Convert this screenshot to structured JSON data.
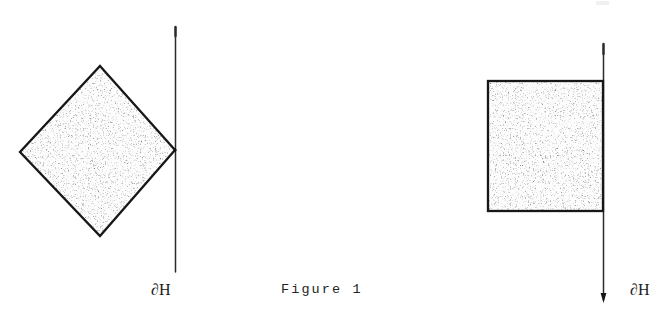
{
  "figure": {
    "caption": "Figure 1",
    "caption_font": "typewriter",
    "background_color": "#ffffff",
    "ink_color": "#1a1a1a",
    "fill_color": "#fefefe",
    "panels": [
      {
        "id": "left-panel",
        "shape": {
          "name": "rotated-square-diamond",
          "type": "polygon",
          "description": "stippled square rotated 45 degrees, right vertex touching the vertical boundary line",
          "vertices": [
            {
              "x": 100,
              "y": 66
            },
            {
              "x": 175,
              "y": 150
            },
            {
              "x": 100,
              "y": 236
            },
            {
              "x": 20,
              "y": 152
            }
          ],
          "filled": true,
          "fill_texture": "stipple"
        },
        "boundary_line": {
          "name": "vertical-boundary-line",
          "label": "∂H",
          "x": 175,
          "y_top": 27,
          "y_bottom": 272,
          "arrowhead": false
        },
        "contact": "vertex-tangent"
      },
      {
        "id": "right-panel",
        "shape": {
          "name": "axis-aligned-square",
          "type": "rect",
          "description": "stippled square whose right edge lies along the vertical boundary line",
          "x": 488,
          "y": 81,
          "width": 115,
          "height": 130,
          "filled": true,
          "fill_texture": "stipple"
        },
        "boundary_line": {
          "name": "vertical-boundary-line",
          "label": "∂H",
          "x": 603,
          "y_top": 44,
          "y_bottom": 303,
          "arrowhead": true
        },
        "contact": "edge-coincident"
      }
    ],
    "labels": {
      "boundary_left": "∂H",
      "boundary_right": "∂H"
    }
  }
}
